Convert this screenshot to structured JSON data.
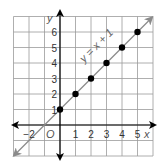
{
  "chart_data": {
    "type": "line",
    "title": "",
    "xlabel": "x",
    "ylabel": "y",
    "origin_label": "O",
    "xlim": [
      -3,
      6
    ],
    "ylim": [
      -2,
      7
    ],
    "grid": true,
    "x_ticks": [
      "−2",
      "1",
      "2",
      "3",
      "4",
      "5"
    ],
    "y_ticks": [
      "1",
      "2",
      "3",
      "4",
      "5",
      "6"
    ],
    "series": [
      {
        "name": "y = x + 1",
        "annotation": "y = x + 1",
        "points": [
          [
            0,
            1
          ],
          [
            1,
            2
          ],
          [
            2,
            3
          ],
          [
            3,
            4
          ],
          [
            4,
            5
          ],
          [
            5,
            6
          ]
        ],
        "line": {
          "slope": 1,
          "intercept": 1,
          "arrows": "both"
        }
      }
    ],
    "colors": {
      "line": "#8a8a8a",
      "points": "#000000",
      "grid": "#9a9a9a",
      "axes": "#000000"
    }
  }
}
